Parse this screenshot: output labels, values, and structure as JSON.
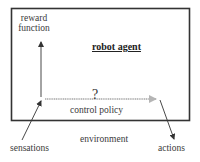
{
  "diagram": {
    "title": "robot agent",
    "nodes": {
      "reward_function": "reward\nfunction",
      "reward_line1": "reward",
      "reward_line2": "function",
      "agent": "robot agent",
      "unknown": "?",
      "control_policy": "control policy",
      "environment": "environment",
      "sensations": "sensations",
      "actions": "actions"
    },
    "edges": [
      {
        "from": "sensations",
        "to": "agent-input",
        "style": "solid-black"
      },
      {
        "from": "agent-input",
        "to": "reward_function",
        "style": "solid-black"
      },
      {
        "from": "agent-input",
        "to": "agent-output",
        "style": "thick-gray",
        "label": "control policy"
      },
      {
        "from": "agent-output",
        "to": "actions",
        "style": "solid-black"
      }
    ],
    "colors": {
      "box_border": "#333333",
      "policy_arrow": "#b8b8b8",
      "lines": "#333333"
    }
  }
}
